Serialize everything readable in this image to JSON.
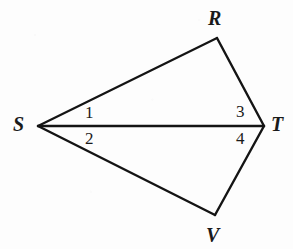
{
  "figure": {
    "kind": "geometry-diagram",
    "canvas": {
      "width": 293,
      "height": 249
    },
    "stroke_color": "#141414",
    "background_color": "#fdfdfd",
    "stroke_width": 2.2,
    "points": {
      "S": {
        "x": 38,
        "y": 126
      },
      "R": {
        "x": 217,
        "y": 38
      },
      "T": {
        "x": 264,
        "y": 126
      },
      "V": {
        "x": 215,
        "y": 215
      }
    },
    "segments": [
      {
        "name": "SR",
        "from": "S",
        "to": "R"
      },
      {
        "name": "RT",
        "from": "R",
        "to": "T"
      },
      {
        "name": "ST",
        "from": "S",
        "to": "T"
      },
      {
        "name": "TV",
        "from": "T",
        "to": "V"
      },
      {
        "name": "VS",
        "from": "V",
        "to": "S"
      }
    ],
    "vertex_labels": [
      {
        "id": "R",
        "text": "R",
        "x": 208,
        "y": 8
      },
      {
        "id": "S",
        "text": "S",
        "x": 13,
        "y": 114
      },
      {
        "id": "T",
        "text": "T",
        "x": 271,
        "y": 114
      },
      {
        "id": "V",
        "text": "V",
        "x": 206,
        "y": 225
      }
    ],
    "angle_labels": [
      {
        "id": "1",
        "text": "1",
        "at_vertex": "S",
        "x": 85,
        "y": 104
      },
      {
        "id": "2",
        "text": "2",
        "at_vertex": "S",
        "x": 85,
        "y": 130
      },
      {
        "id": "3",
        "text": "3",
        "at_vertex": "T",
        "x": 236,
        "y": 103
      },
      {
        "id": "4",
        "text": "4",
        "at_vertex": "T",
        "x": 236,
        "y": 130
      }
    ]
  }
}
